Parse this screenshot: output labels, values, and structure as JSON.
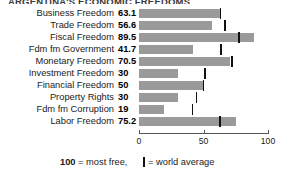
{
  "title_clipped": "ARGENTINA'S ECONOMIC FREEDOMS",
  "legend": {
    "most_free_number": "100",
    "most_free_text": " = most free,",
    "world_average_text": "= world average",
    "marker_glyph": "vertical-bar"
  },
  "colors": {
    "bar_fill": "#9a9a9a",
    "marker": "#111111",
    "axis": "#555555",
    "text": "#1a1a1a"
  },
  "chart_data": {
    "type": "bar",
    "orientation": "horizontal",
    "title": "ARGENTINA'S ECONOMIC FREEDOMS",
    "xlabel": "",
    "ylabel": "",
    "xlim": [
      0,
      100
    ],
    "xticks": [
      0,
      50,
      100
    ],
    "xtick_labels": [
      "0",
      "50",
      "100"
    ],
    "grid": false,
    "legend_position": "bottom",
    "categories": [
      "Business Freedom",
      "Trade Freedom",
      "Fiscal Freedom",
      "Fdm fm Government",
      "Monetary Freedom",
      "Investment Freedom",
      "Financial Freedom",
      "Property Rights",
      "Fdm fm Corruption",
      "Labor Freedom"
    ],
    "values": [
      63.1,
      56.6,
      89.5,
      41.7,
      70.5,
      30,
      50,
      30,
      19,
      75.2
    ],
    "value_labels": [
      "63.1",
      "56.6",
      "89.5",
      "41.7",
      "70.5",
      "30",
      "50",
      "30",
      "19",
      "75.2"
    ],
    "series": [
      {
        "name": "Argentina score",
        "values": [
          63.1,
          56.6,
          89.5,
          41.7,
          70.5,
          30,
          50,
          30,
          19,
          75.2
        ]
      },
      {
        "name": "world average",
        "marker": "vertical-bar",
        "values": [
          62.5,
          66.0,
          77.0,
          63.0,
          71.5,
          50.5,
          49.5,
          44.0,
          41.0,
          62.0
        ]
      }
    ]
  }
}
